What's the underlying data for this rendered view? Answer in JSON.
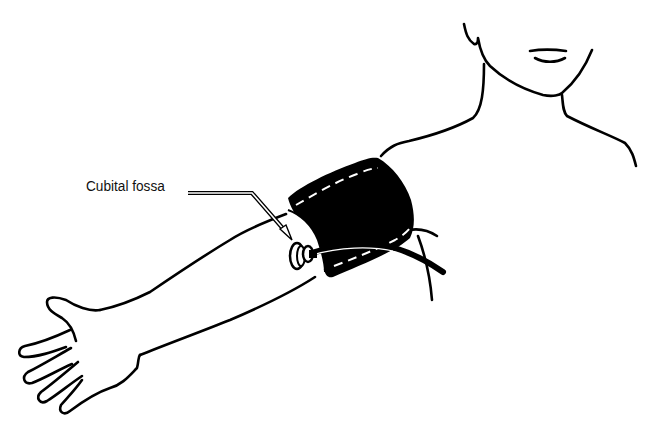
{
  "figure": {
    "labels": [
      {
        "id": "cubital-fossa",
        "text": "Cubital fossa"
      }
    ],
    "colors": {
      "line": "#000000",
      "cuff": "#000000",
      "background": "#ffffff"
    }
  }
}
